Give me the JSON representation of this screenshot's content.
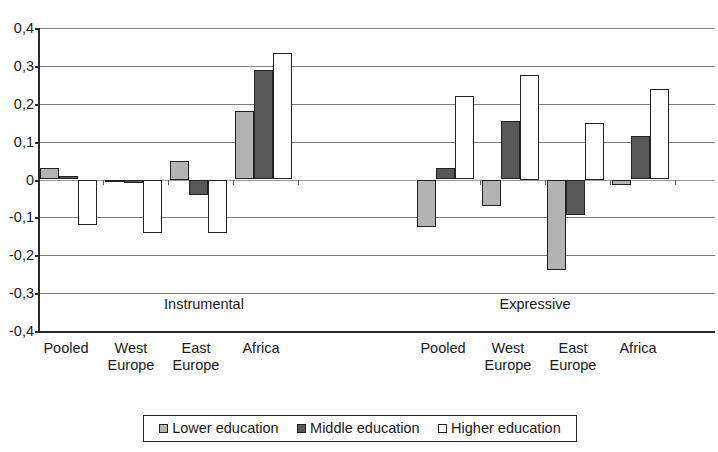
{
  "chart_data": {
    "type": "bar",
    "title": "",
    "subtitle": "",
    "xlabel": "",
    "ylabel": "",
    "ylim": [
      -0.4,
      0.4
    ],
    "grid": true,
    "legend_position": "bottom",
    "decimal_separator": ",",
    "y_ticks": [
      "0,4",
      "0,3",
      "0,2",
      "0,1",
      "0",
      "-0,1",
      "-0,2",
      "-0,3",
      "-0,4"
    ],
    "y_tick_values": [
      0.4,
      0.3,
      0.2,
      0.1,
      0,
      -0.1,
      -0.2,
      -0.3,
      -0.4
    ],
    "panels": [
      "Instrumental",
      "Expressive"
    ],
    "categories": [
      "Pooled",
      "West Europe",
      "East Europe",
      "Africa"
    ],
    "series": [
      {
        "name": "Lower education",
        "color": "#b3b3b3",
        "values_instrumental": [
          0.03,
          -0.005,
          0.05,
          0.18
        ],
        "values_expressive": [
          -0.125,
          -0.07,
          -0.24,
          -0.015
        ]
      },
      {
        "name": "Middle education",
        "color": "#585858",
        "values_instrumental": [
          0.01,
          -0.01,
          -0.04,
          0.29
        ],
        "values_expressive": [
          0.03,
          0.155,
          -0.095,
          0.115
        ]
      },
      {
        "name": "Higher education",
        "color": "#ffffff",
        "values_instrumental": [
          -0.12,
          -0.14,
          -0.14,
          0.335
        ],
        "values_expressive": [
          0.22,
          0.275,
          0.15,
          0.24
        ]
      }
    ]
  },
  "axis": {
    "ticks": [
      {
        "label": "0,4",
        "value": 0.4
      },
      {
        "label": "0,3",
        "value": 0.3
      },
      {
        "label": "0,2",
        "value": 0.2
      },
      {
        "label": "0,1",
        "value": 0.1
      },
      {
        "label": "0",
        "value": 0
      },
      {
        "label": "-0,1",
        "value": -0.1
      },
      {
        "label": "-0,2",
        "value": -0.2
      },
      {
        "label": "-0,3",
        "value": -0.3
      },
      {
        "label": "-0,4",
        "value": -0.4
      }
    ]
  },
  "panel_labels": {
    "instrumental": "Instrumental",
    "expressive": "Expressive"
  },
  "category_labels": {
    "instrumental": [
      "Pooled",
      "West\nEurope",
      "East\nEurope",
      "Africa"
    ],
    "expressive": [
      "Pooled",
      "West\nEurope",
      "East\nEurope",
      "Africa"
    ]
  },
  "legend": {
    "items": [
      {
        "label": "Lower education",
        "swatch": "lower"
      },
      {
        "label": "Middle education",
        "swatch": "middle"
      },
      {
        "label": "Higher education",
        "swatch": "higher"
      }
    ]
  }
}
